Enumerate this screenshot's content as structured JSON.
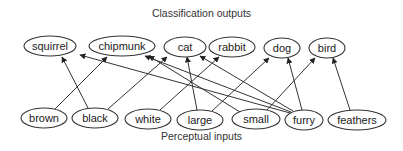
{
  "titles": {
    "top": "Classification outputs",
    "bottom": "Perceptual inputs"
  },
  "outputs": [
    {
      "id": "squirrel",
      "label": "squirrel",
      "cx": 50,
      "cy": 46,
      "rx": 26,
      "ry": 10
    },
    {
      "id": "chipmunk",
      "label": "chipmunk",
      "cx": 122,
      "cy": 46,
      "rx": 33,
      "ry": 10
    },
    {
      "id": "cat",
      "label": "cat",
      "cx": 185,
      "cy": 47,
      "rx": 21,
      "ry": 10
    },
    {
      "id": "rabbit",
      "label": "rabbit",
      "cx": 232,
      "cy": 47,
      "rx": 23,
      "ry": 10
    },
    {
      "id": "dog",
      "label": "dog",
      "cx": 282,
      "cy": 48,
      "rx": 18,
      "ry": 10
    },
    {
      "id": "bird",
      "label": "bird",
      "cx": 327,
      "cy": 48,
      "rx": 18,
      "ry": 10
    }
  ],
  "inputs": [
    {
      "id": "brown",
      "label": "brown",
      "cx": 44,
      "cy": 118,
      "rx": 23,
      "ry": 10
    },
    {
      "id": "black",
      "label": "black",
      "cx": 95,
      "cy": 118,
      "rx": 23,
      "ry": 10
    },
    {
      "id": "white",
      "label": "white",
      "cx": 148,
      "cy": 119,
      "rx": 23,
      "ry": 10
    },
    {
      "id": "large",
      "label": "large",
      "cx": 200,
      "cy": 120,
      "rx": 23,
      "ry": 10
    },
    {
      "id": "small",
      "label": "small",
      "cx": 256,
      "cy": 119,
      "rx": 24,
      "ry": 10
    },
    {
      "id": "furry",
      "label": "furry",
      "cx": 304,
      "cy": 120,
      "rx": 19,
      "ry": 10
    },
    {
      "id": "feathers",
      "label": "feathers",
      "cx": 357,
      "cy": 120,
      "rx": 29,
      "ry": 10
    }
  ],
  "edges": [
    {
      "from": "brown",
      "to": "chipmunk",
      "x1": 55,
      "y1": 109,
      "x2": 107,
      "y2": 57
    },
    {
      "from": "black",
      "to": "squirrel",
      "x1": 88,
      "y1": 108,
      "x2": 62,
      "y2": 57
    },
    {
      "from": "black",
      "to": "cat",
      "x1": 108,
      "y1": 109,
      "x2": 167,
      "y2": 57
    },
    {
      "from": "white",
      "to": "rabbit",
      "x1": 160,
      "y1": 110,
      "x2": 219,
      "y2": 57
    },
    {
      "from": "large",
      "to": "cat",
      "x1": 197,
      "y1": 110,
      "x2": 187,
      "y2": 57
    },
    {
      "from": "large",
      "to": "dog",
      "x1": 212,
      "y1": 111,
      "x2": 269,
      "y2": 58
    },
    {
      "from": "small",
      "to": "chipmunk",
      "x1": 240,
      "y1": 112,
      "x2": 149,
      "y2": 56
    },
    {
      "from": "small",
      "to": "bird",
      "x1": 266,
      "y1": 111,
      "x2": 315,
      "y2": 58
    },
    {
      "from": "furry",
      "to": "squirrel",
      "x1": 290,
      "y1": 113,
      "x2": 80,
      "y2": 55
    },
    {
      "from": "furry",
      "to": "chipmunk",
      "x1": 291,
      "y1": 112,
      "x2": 145,
      "y2": 56
    },
    {
      "from": "furry",
      "to": "cat",
      "x1": 293,
      "y1": 111,
      "x2": 200,
      "y2": 56
    },
    {
      "from": "furry",
      "to": "dog",
      "x1": 302,
      "y1": 110,
      "x2": 288,
      "y2": 58
    },
    {
      "from": "feathers",
      "to": "bird",
      "x1": 350,
      "y1": 110,
      "x2": 333,
      "y2": 58
    }
  ]
}
